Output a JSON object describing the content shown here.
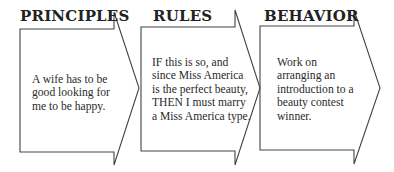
{
  "diagram": {
    "stroke_color": "#444444",
    "steps": [
      {
        "heading": "PRINCIPLES",
        "text": "A wife has to be good looking for me to be happy."
      },
      {
        "heading": "RULES",
        "text": "IF this is so, and since Miss America is the perfect beauty, THEN I must marry a Miss America type."
      },
      {
        "heading": "BEHAVIOR",
        "text": "Work on arranging an introduction to a beauty contest winner."
      }
    ]
  }
}
